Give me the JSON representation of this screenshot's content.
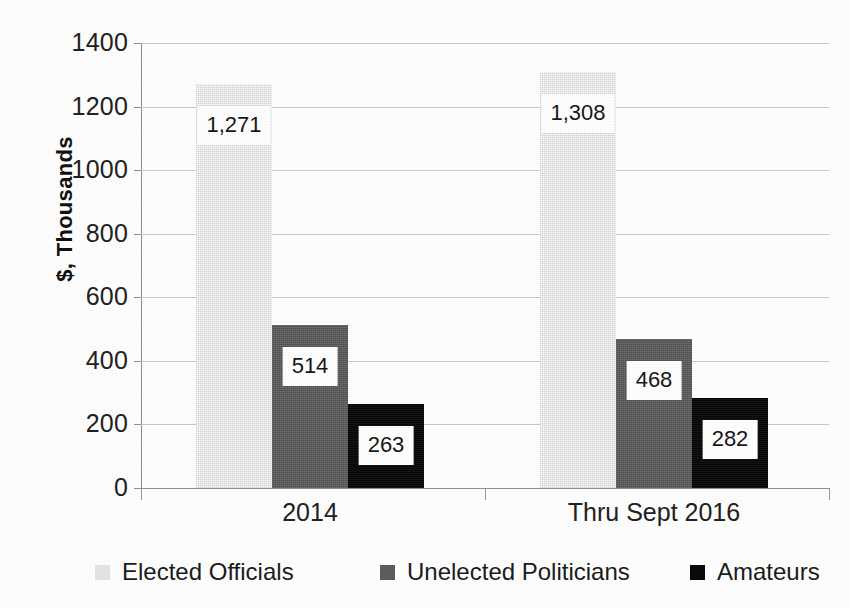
{
  "chart_data": {
    "type": "bar",
    "title": "",
    "xlabel": "",
    "ylabel": "$, Thousands",
    "ylim": [
      0,
      1400
    ],
    "ytick_step": 200,
    "grid": true,
    "legend_position": "bottom",
    "categories": [
      "2014",
      "Thru Sept 2016"
    ],
    "yticks": [
      "0",
      "200",
      "400",
      "600",
      "800",
      "1000",
      "1200",
      "1400"
    ],
    "series": [
      {
        "name": "Elected Officials",
        "color": "#e3e3e3",
        "values": [
          1271,
          1308
        ],
        "labels": [
          "1,271",
          "1,308"
        ]
      },
      {
        "name": "Unelected Politicians",
        "color": "#5c5c5c",
        "values": [
          514,
          468
        ],
        "labels": [
          "514",
          "468"
        ]
      },
      {
        "name": "Amateurs",
        "color": "#0a0a0a",
        "values": [
          263,
          282
        ],
        "labels": [
          "263",
          "282"
        ]
      }
    ]
  },
  "axis": {
    "y_title": "$, Thousands"
  },
  "legend": {
    "items": [
      {
        "label": "Elected Officials",
        "swatch": "legend-swatch-elected-officials"
      },
      {
        "label": "Unelected Politicians",
        "swatch": "legend-swatch-unelected-politicians"
      },
      {
        "label": "Amateurs",
        "swatch": "legend-swatch-amateurs"
      }
    ]
  }
}
